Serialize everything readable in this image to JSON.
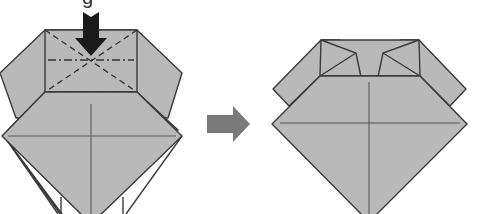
{
  "caption_fragment": "g",
  "steps": [
    {
      "id": "before",
      "description": "Squash fold top rectangle along valley (dashed) and mountain (dash-dot) lines",
      "push_arrow": {
        "direction": "down",
        "color": "#1a1a1a"
      }
    },
    {
      "id": "after",
      "description": "Result: top flap collapsed into trapezoid with inward-folded points"
    }
  ],
  "transition_arrow": {
    "direction": "right",
    "color": "#777777"
  },
  "colors": {
    "paper": "#b9b9b9",
    "outline": "#3a3a3a",
    "background": "#ffffff"
  },
  "line_types": [
    "edge",
    "crease",
    "valley-fold",
    "mountain-fold"
  ]
}
